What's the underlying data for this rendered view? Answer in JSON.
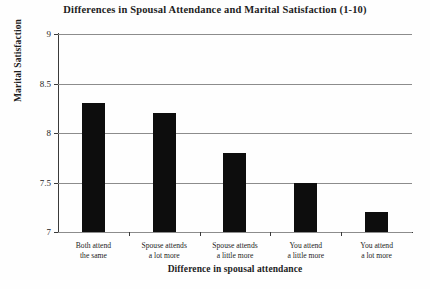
{
  "chart_data": {
    "type": "bar",
    "title": "Differences in Spousal Attendance and Marital Satisfaction (1-10)",
    "title_line1": "Differences in Spousal Attendance and Marital",
    "title_line2": "Satisfaction (1-10)",
    "xlabel": "Difference in spousal attendance",
    "ylabel": "Marital Satisfaction",
    "categories": [
      "Both attend the same",
      "Spouse attends a lot more",
      "Spouse attends a little more",
      "You attend a little more",
      "You attend a lot more"
    ],
    "category_lines": [
      [
        "Both attend",
        "the same"
      ],
      [
        "Spouse attends",
        "a lot more"
      ],
      [
        "Spouse attends",
        "a little more"
      ],
      [
        "You attend",
        "a little more"
      ],
      [
        "You attend",
        "a lot more"
      ]
    ],
    "values": [
      8.3,
      8.2,
      7.8,
      7.5,
      7.2
    ],
    "ylim": [
      7,
      9
    ],
    "yticks": [
      7,
      7.5,
      8,
      8.5,
      9
    ],
    "ytick_labels": [
      "7",
      "7.5",
      "8",
      "8.5",
      "9"
    ],
    "grid": true,
    "legend": null,
    "bar_color": "#0d0d0d",
    "gridline_color": "#8c8c8c",
    "axis_color": "#3a3a3a",
    "background_color": "#fefefe"
  }
}
